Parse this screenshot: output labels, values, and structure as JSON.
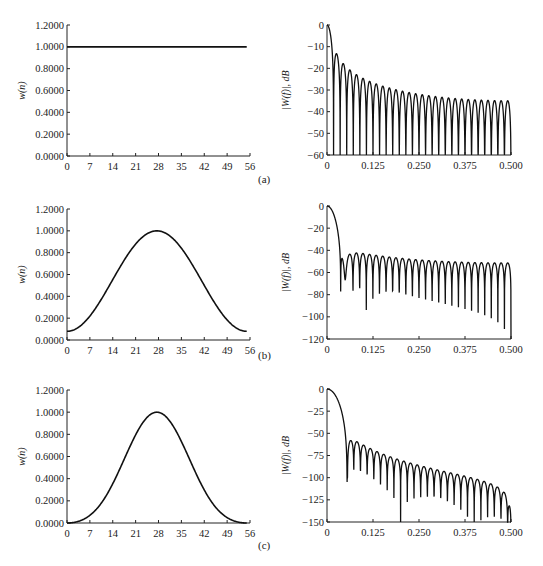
{
  "chart_data": [
    {
      "panel": "(a)",
      "type": "line",
      "title": "",
      "xlabel": "",
      "ylabel": "w(n)",
      "xlim": [
        0,
        56
      ],
      "ylim": [
        0,
        1.2
      ],
      "xticks": [
        "0",
        "7",
        "14",
        "21",
        "28",
        "35",
        "42",
        "49",
        "56"
      ],
      "yticks": [
        "0.0000",
        "0.2000",
        "0.4000",
        "0.6000",
        "0.8000",
        "1.0000",
        "1.2000"
      ],
      "window": "rectangular",
      "series": [
        {
          "name": "w(n)",
          "x": [
            0,
            56
          ],
          "y": [
            1.0,
            1.0
          ]
        }
      ]
    },
    {
      "panel": "(a)",
      "type": "line",
      "title": "",
      "xlabel": "",
      "ylabel": "|W(f)|, dB",
      "xlim": [
        0,
        0.5
      ],
      "ylim": [
        -60,
        0
      ],
      "xticks": [
        "0",
        "0.125",
        "0.250",
        "0.375",
        "0.500"
      ],
      "yticks": [
        "0",
        "-10",
        "-20",
        "-30",
        "-40",
        "-50",
        "-60"
      ],
      "window": "rectangular",
      "sidelobe_peak_db": -13,
      "sidelobe_tail_db": -34
    },
    {
      "panel": "(b)",
      "type": "line",
      "title": "",
      "xlabel": "",
      "ylabel": "w(n)",
      "xlim": [
        0,
        56
      ],
      "ylim": [
        0,
        1.2
      ],
      "xticks": [
        "0",
        "7",
        "14",
        "21",
        "28",
        "35",
        "42",
        "49",
        "56"
      ],
      "yticks": [
        "0.0000",
        "0.2000",
        "0.4000",
        "0.6000",
        "0.8000",
        "1.0000",
        "1.2000"
      ],
      "window": "hamming",
      "series": [
        {
          "name": "w(n)",
          "x": [
            0,
            7,
            14,
            21,
            28,
            35,
            42,
            49,
            55
          ],
          "y": [
            0.08,
            0.22,
            0.54,
            0.86,
            1.0,
            0.86,
            0.54,
            0.22,
            0.08
          ]
        }
      ]
    },
    {
      "panel": "(b)",
      "type": "line",
      "title": "",
      "xlabel": "",
      "ylabel": "|W(f)|, dB",
      "xlim": [
        0,
        0.5
      ],
      "ylim": [
        -120,
        0
      ],
      "xticks": [
        "0",
        "0.125",
        "0.250",
        "0.375",
        "0.500"
      ],
      "yticks": [
        "0",
        "-20",
        "-40",
        "-60",
        "-80",
        "-100",
        "-120"
      ],
      "window": "hamming",
      "sidelobe_peak_db": -43,
      "sidelobe_tail_db": -53
    },
    {
      "panel": "(c)",
      "type": "line",
      "title": "",
      "xlabel": "",
      "ylabel": "w(n)",
      "xlim": [
        0,
        56
      ],
      "ylim": [
        0,
        1.2
      ],
      "xticks": [
        "0",
        "7",
        "14",
        "21",
        "28",
        "35",
        "42",
        "49",
        "56"
      ],
      "yticks": [
        "0.0000",
        "0.2000",
        "0.4000",
        "0.6000",
        "0.8000",
        "1.0000",
        "1.2000"
      ],
      "window": "blackman",
      "series": [
        {
          "name": "w(n)",
          "x": [
            0,
            7,
            14,
            21,
            28,
            35,
            42,
            49,
            55
          ],
          "y": [
            0.0,
            0.07,
            0.34,
            0.77,
            1.0,
            0.77,
            0.34,
            0.07,
            0.0
          ]
        }
      ]
    },
    {
      "panel": "(c)",
      "type": "line",
      "title": "",
      "xlabel": "",
      "ylabel": "|W(f)|, dB",
      "xlim": [
        0,
        0.5
      ],
      "ylim": [
        -150,
        0
      ],
      "xticks": [
        "0",
        "0.125",
        "0.250",
        "0.375",
        "0.500"
      ],
      "yticks": [
        "0",
        "-25",
        "-50",
        "-75",
        "-100",
        "-125",
        "-150"
      ],
      "window": "blackman",
      "sidelobe_peak_db": -58,
      "sidelobe_tail_db": -120
    }
  ],
  "labels": {
    "a": "(a)",
    "b": "(b)",
    "c": "(c)"
  }
}
